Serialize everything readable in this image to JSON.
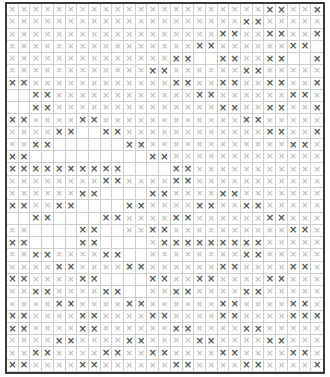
{
  "pattern": {
    "columns": 27,
    "rows": 30,
    "symbol": "×",
    "colors": {
      "dark_mark": "#555555",
      "light_mark": "#c4c4c4",
      "grid_line": "#cfcfcf",
      "border": "#3a3a3a"
    },
    "dark_cells": [
      [
        22,
        23,
        26
      ],
      [
        20,
        21
      ],
      [
        18,
        19,
        22,
        23,
        26
      ],
      [
        16,
        17,
        24,
        25
      ],
      [
        14,
        15,
        18,
        19,
        22,
        23,
        26
      ],
      [
        12,
        13,
        20,
        21
      ],
      [
        0,
        1,
        14,
        15,
        18,
        19,
        22,
        23,
        26
      ],
      [
        2,
        3,
        16,
        17,
        24,
        25
      ],
      [
        2,
        3,
        18,
        19,
        22,
        23,
        26
      ],
      [
        0,
        1,
        6,
        7,
        20,
        21
      ],
      [
        4,
        5,
        8,
        9,
        22,
        23,
        26
      ],
      [
        2,
        3,
        10,
        11,
        24,
        25
      ],
      [
        0,
        1,
        12,
        13
      ],
      [
        0,
        1,
        2,
        3,
        4,
        5,
        6,
        7,
        8,
        9,
        14,
        15
      ],
      [
        8,
        9,
        14,
        15
      ],
      [
        6,
        7,
        12,
        13,
        18,
        19
      ],
      [
        0,
        1,
        4,
        5,
        10,
        11,
        16,
        17,
        20,
        21
      ],
      [
        2,
        3,
        8,
        9,
        14,
        15,
        22,
        23
      ],
      [
        6,
        7,
        12,
        13,
        24,
        25
      ],
      [
        0,
        1,
        6,
        7,
        13,
        14,
        15,
        16,
        17,
        18,
        19,
        20,
        21
      ],
      [
        2,
        3,
        8,
        9,
        20,
        21
      ],
      [
        4,
        5,
        10,
        11,
        18,
        19,
        24,
        25
      ],
      [
        0,
        1,
        6,
        7,
        12,
        13,
        16,
        17,
        22,
        23
      ],
      [
        2,
        3,
        8,
        9,
        14,
        15,
        20,
        21
      ],
      [
        4,
        5,
        10,
        11,
        18,
        19,
        24,
        25
      ],
      [
        0,
        1,
        6,
        7,
        12,
        13,
        18,
        19,
        24,
        25,
        26
      ],
      [
        0,
        1,
        6,
        7,
        14,
        15,
        20,
        21
      ],
      [
        4,
        5,
        10,
        11,
        16,
        17,
        22,
        23
      ],
      [
        2,
        3,
        8,
        9,
        12,
        13,
        18,
        19,
        24,
        25
      ],
      [
        0,
        1,
        6,
        7,
        14,
        15,
        20,
        21,
        26
      ]
    ],
    "blank_cells": [
      [],
      [],
      [],
      [
        26
      ],
      [
        16,
        17,
        24,
        25
      ],
      [],
      [],
      [
        0,
        1
      ],
      [
        0,
        1
      ],
      [],
      [
        6,
        7
      ],
      [
        4,
        5,
        6,
        7,
        8,
        9
      ],
      [
        2,
        3,
        4,
        5,
        6,
        7,
        8,
        9,
        10,
        11
      ],
      [
        10,
        11,
        12,
        13
      ],
      [],
      [
        8,
        9,
        10,
        11
      ],
      [
        6,
        7,
        8,
        9
      ],
      [
        0,
        1,
        4,
        5,
        6,
        7
      ],
      [
        2,
        3,
        4,
        5,
        8,
        9
      ],
      [
        2,
        3,
        4,
        5,
        8,
        9,
        10,
        11
      ],
      [
        10,
        11
      ],
      [],
      [
        8,
        9,
        10,
        11
      ],
      [
        10,
        11
      ],
      [],
      [],
      [],
      [],
      [],
      []
    ]
  }
}
